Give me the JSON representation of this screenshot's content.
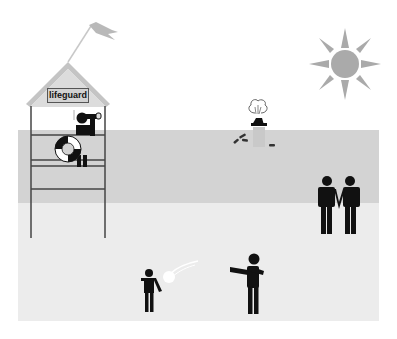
{
  "scene": {
    "title": "Beach scene illustration",
    "colors": {
      "sky": "#ffffff",
      "water": "#d3d3d3",
      "sand": "#ececec",
      "figures": "#111111",
      "sun": "#aaaaaa",
      "flag": "#b9b9b9",
      "roof": "#c4c4c4",
      "roof_fill": "#dcdcdc"
    }
  },
  "tower": {
    "sign_label": "lifeguard"
  },
  "elements": {
    "sun": "sun-icon",
    "flag": "flag-icon",
    "lifebuoy": "lifebuoy-icon",
    "lifeguard": "person-with-binoculars-icon",
    "drowning_swimmer": "drowning-person-icon",
    "couple": "couple-icon",
    "child": "child-icon",
    "ball": "ball-icon",
    "adult_thrower": "person-throwing-icon"
  }
}
